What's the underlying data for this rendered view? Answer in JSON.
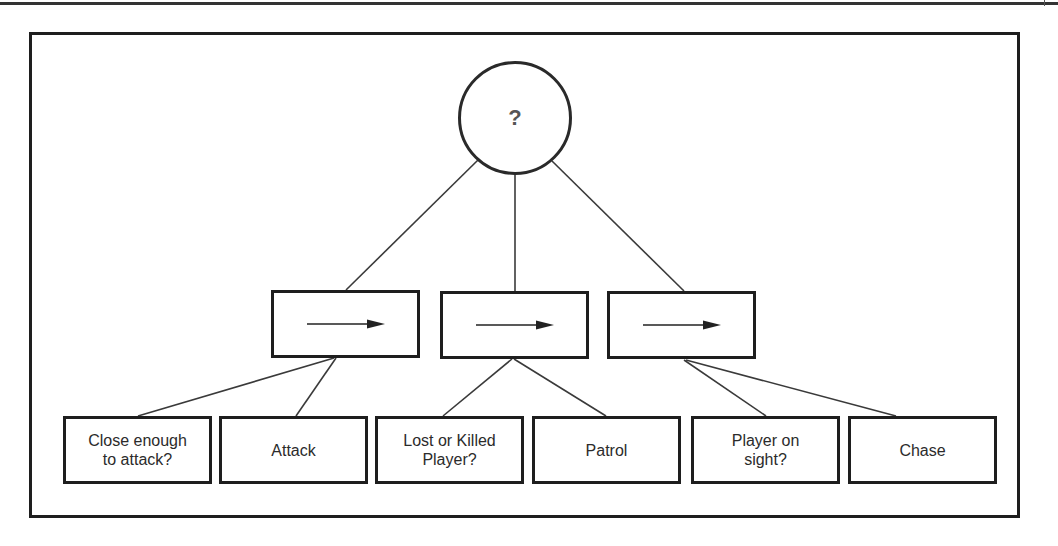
{
  "diagram": {
    "type": "behavior-tree",
    "root": {
      "symbol": "?",
      "kind": "selector"
    },
    "sequences": [
      {
        "symbol": "→",
        "kind": "sequence",
        "children": [
          0,
          1
        ]
      },
      {
        "symbol": "→",
        "kind": "sequence",
        "children": [
          2,
          3
        ]
      },
      {
        "symbol": "→",
        "kind": "sequence",
        "children": [
          4,
          5
        ]
      }
    ],
    "leaves": [
      {
        "label": "Close enough\nto attack?",
        "kind": "condition"
      },
      {
        "label": "Attack",
        "kind": "action"
      },
      {
        "label": "Lost or Killed\nPlayer?",
        "kind": "condition"
      },
      {
        "label": "Patrol",
        "kind": "action"
      },
      {
        "label": "Player on\nsight?",
        "kind": "condition"
      },
      {
        "label": "Chase",
        "kind": "action"
      }
    ]
  },
  "colors": {
    "line": "#333333",
    "border": "#1e1e1e",
    "background": "#ffffff",
    "text": "#2b2b2b"
  }
}
